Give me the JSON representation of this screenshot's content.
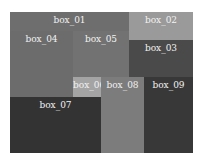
{
  "chart_data": {
    "type": "treemap",
    "title": "",
    "boxes": [
      {
        "label": "box_01",
        "x": 10,
        "y": 12,
        "w": 119,
        "h": 19,
        "color": "#6e6e6e"
      },
      {
        "label": "box_02",
        "x": 129,
        "y": 12,
        "w": 64,
        "h": 28,
        "color": "#9a9a9a"
      },
      {
        "label": "box_03",
        "x": 129,
        "y": 40,
        "w": 64,
        "h": 37,
        "color": "#4a4a4a"
      },
      {
        "label": "box_04",
        "x": 10,
        "y": 31,
        "w": 63,
        "h": 66,
        "color": "#6c6c6c"
      },
      {
        "label": "box_05",
        "x": 73,
        "y": 31,
        "w": 56,
        "h": 46,
        "color": "#727272"
      },
      {
        "label": "box_06",
        "x": 73,
        "y": 77,
        "w": 28,
        "h": 20,
        "color": "#a4a4a4"
      },
      {
        "label": "box_07",
        "x": 10,
        "y": 97,
        "w": 91,
        "h": 56,
        "color": "#333333"
      },
      {
        "label": "box_08",
        "x": 101,
        "y": 77,
        "w": 43,
        "h": 76,
        "color": "#7c7c7c"
      },
      {
        "label": "box_09",
        "x": 144,
        "y": 77,
        "w": 49,
        "h": 76,
        "color": "#383838"
      }
    ]
  }
}
